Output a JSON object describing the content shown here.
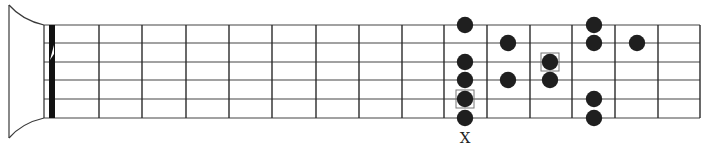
{
  "diagram": {
    "colors": {
      "line": "#2a2a2a",
      "string": "#444444",
      "dot": "#1f1f1f",
      "box": "#777777",
      "background": "#ffffff"
    },
    "strings_y": [
      25,
      43,
      62,
      80,
      99,
      118
    ],
    "frets_x": [
      99,
      142,
      186,
      229,
      272,
      316,
      359,
      402,
      444,
      487,
      530,
      572,
      615,
      658,
      700
    ],
    "nut": {
      "line_x": 44,
      "bar_x": 49,
      "bar_width": 6
    },
    "notes": [
      {
        "x": 465,
        "string": 1,
        "root": false
      },
      {
        "x": 465,
        "string": 3,
        "root": false
      },
      {
        "x": 465,
        "string": 4,
        "root": false
      },
      {
        "x": 465,
        "string": 5,
        "root": true
      },
      {
        "x": 465,
        "string": 6,
        "root": false
      },
      {
        "x": 508,
        "string": 2,
        "root": false
      },
      {
        "x": 508,
        "string": 4,
        "root": false
      },
      {
        "x": 550,
        "string": 3,
        "root": true
      },
      {
        "x": 550,
        "string": 4,
        "root": false
      },
      {
        "x": 594,
        "string": 1,
        "root": false
      },
      {
        "x": 594,
        "string": 2,
        "root": false
      },
      {
        "x": 594,
        "string": 5,
        "root": false
      },
      {
        "x": 594,
        "string": 6,
        "root": false
      },
      {
        "x": 637,
        "string": 2,
        "root": false
      }
    ],
    "marker": {
      "text": "X",
      "x": 465,
      "y": 143
    }
  }
}
